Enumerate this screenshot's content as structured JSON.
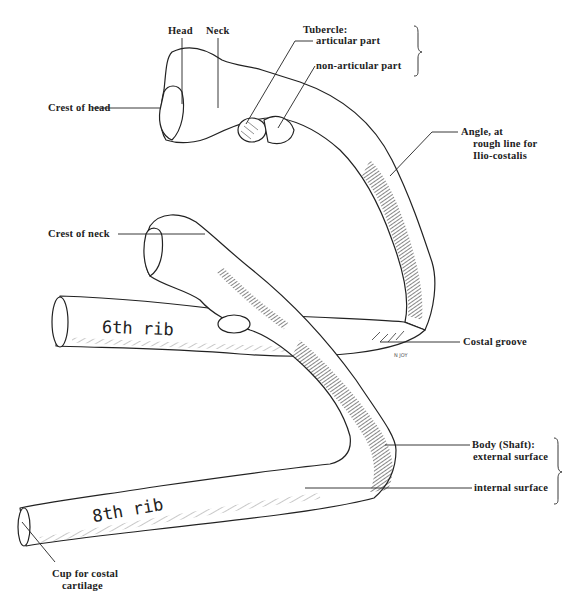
{
  "figure": {
    "ribs": [
      {
        "id": "rib6",
        "label": "6th rib"
      },
      {
        "id": "rib8",
        "label": "8th rib"
      }
    ],
    "signature": "N JOY",
    "colors": {
      "ink": "#222222",
      "background": "#ffffff",
      "shading": "#333333"
    }
  },
  "labels": {
    "head": "Head",
    "neck": "Neck",
    "tubercle_title": "Tubercle:",
    "tubercle_articular": "articular part",
    "tubercle_nonarticular": "non-articular part",
    "crest_of_head": "Crest of head",
    "angle_line1": "Angle, at",
    "angle_line2": "rough line for",
    "angle_line3": "Ilio-costalis",
    "crest_of_neck": "Crest of neck",
    "costal_groove": "Costal groove",
    "body_line1": "Body (Shaft):",
    "body_external": "external surface",
    "body_internal": "internal surface",
    "cup_line1": "Cup for costal",
    "cup_line2": "cartilage"
  }
}
